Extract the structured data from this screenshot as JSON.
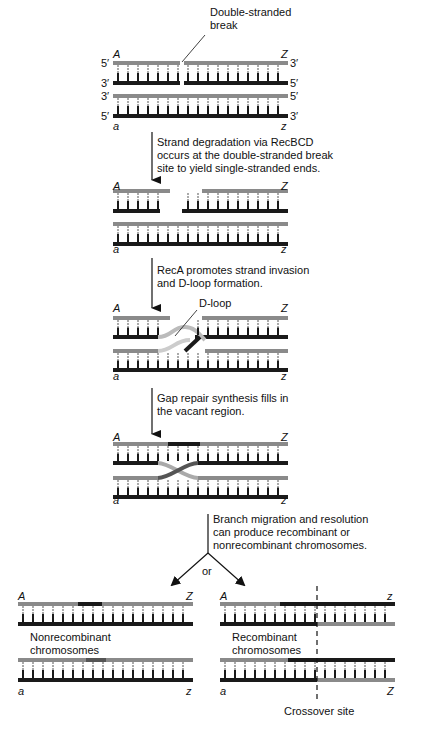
{
  "labels": {
    "dsb": [
      "Double-stranded",
      "break"
    ],
    "ends_left": [
      "5′",
      "3′",
      "3′",
      "5′"
    ],
    "ends_right": [
      "3′",
      "5′",
      "5′",
      "3′"
    ],
    "A": "A",
    "Z": "Z",
    "a": "a",
    "z": "z",
    "dloop": "D-loop",
    "or": "or",
    "nonrecombinant": [
      "Nonrecombinant",
      "chromosomes"
    ],
    "recombinant": [
      "Recombinant",
      "chromosomes"
    ],
    "crossover": "Crossover site"
  },
  "steps": [
    {
      "text": [
        "Strand degradation via RecBCD",
        "occurs at the double-stranded break",
        "site to yield single-stranded ends."
      ]
    },
    {
      "text": [
        "RecA promotes strand invasion",
        "and D-loop formation."
      ]
    },
    {
      "text": [
        "Gap repair synthesis fills in",
        "the vacant region."
      ]
    },
    {
      "text": [
        "Branch migration and resolution",
        "can produce recombinant or",
        "nonrecombinant chromosomes."
      ]
    }
  ],
  "colors": {
    "light": "#8a8a8a",
    "dark": "#1a1a1a",
    "mid": "#555555"
  }
}
